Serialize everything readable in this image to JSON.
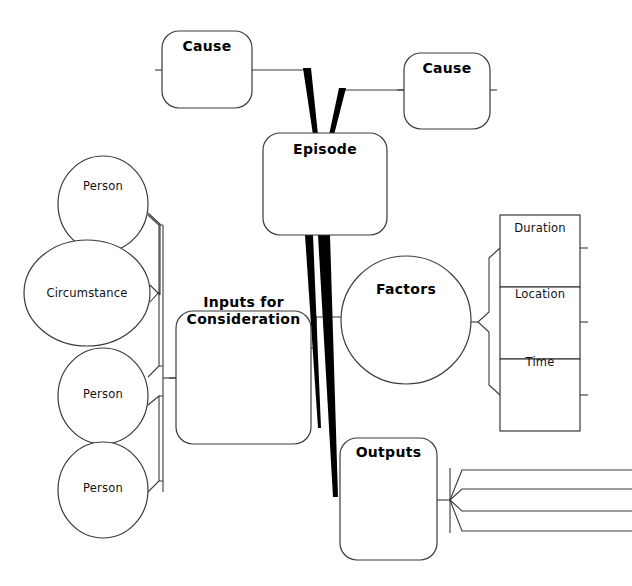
{
  "diagram": {
    "background_color": "#ffffff",
    "stroke_color": "#333333",
    "thick_stroke_color": "#000000",
    "text_color": "#000000"
  },
  "nodes": {
    "cause_left": {
      "label": "Cause",
      "shape": "rounded-rect",
      "x": 162,
      "y": 31,
      "width": 90,
      "height": 77,
      "style": "bold"
    },
    "cause_right": {
      "label": "Cause",
      "shape": "rounded-rect",
      "x": 404,
      "y": 53,
      "width": 86,
      "height": 76,
      "style": "bold"
    },
    "episode": {
      "label": "Episode",
      "shape": "rounded-rect",
      "x": 263,
      "y": 133,
      "width": 124,
      "height": 102,
      "style": "bold"
    },
    "inputs": {
      "label": "Inputs for\nConsideration",
      "shape": "rounded-rect",
      "x": 176,
      "y": 311,
      "width": 135,
      "height": 133,
      "style": "bold"
    },
    "factors": {
      "label": "Factors",
      "shape": "circle",
      "cx": 406,
      "cy": 320,
      "rx": 65,
      "ry": 64,
      "style": "bold"
    },
    "outputs": {
      "label": "Outputs",
      "shape": "rounded-rect",
      "x": 340,
      "y": 438,
      "width": 97,
      "height": 122,
      "style": "bold"
    },
    "person_1": {
      "label": "Person",
      "shape": "circle",
      "cx": 103,
      "cy": 204,
      "rx": 45,
      "ry": 48,
      "style": "plain"
    },
    "circumstance": {
      "label": "Circumstance",
      "shape": "circle",
      "cx": 87,
      "cy": 293,
      "rx": 63,
      "ry": 53,
      "style": "plain"
    },
    "person_2": {
      "label": "Person",
      "shape": "circle",
      "cx": 103,
      "cy": 396,
      "rx": 45,
      "ry": 48,
      "style": "plain"
    },
    "person_3": {
      "label": "Person",
      "shape": "circle",
      "cx": 103,
      "cy": 490,
      "rx": 45,
      "ry": 48,
      "style": "plain"
    },
    "duration": {
      "label": "Duration",
      "shape": "rect",
      "x": 500,
      "y": 215,
      "width": 80,
      "height": 72,
      "style": "plain"
    },
    "location": {
      "label": "Location",
      "shape": "rect",
      "x": 500,
      "y": 287,
      "width": 80,
      "height": 72,
      "style": "plain"
    },
    "time": {
      "label": "Time",
      "shape": "rect",
      "x": 500,
      "y": 359,
      "width": 80,
      "height": 72,
      "style": "plain"
    }
  },
  "connectors": {
    "cause_left_to_episode": "tapered-wedge",
    "cause_right_to_episode": "tapered-wedge",
    "episode_to_inputs": "tapered-wedge",
    "episode_to_outputs": "tapered-wedge",
    "inputs_to_factors": "thin-line",
    "persons_bracket": "curly-brace",
    "factors_bracket": "curly-brace",
    "outputs_fan": "four-branch-fan",
    "outputs_branch_count": 4
  },
  "stubs": {
    "description": "short connector stubs on node edges",
    "count": 9
  }
}
